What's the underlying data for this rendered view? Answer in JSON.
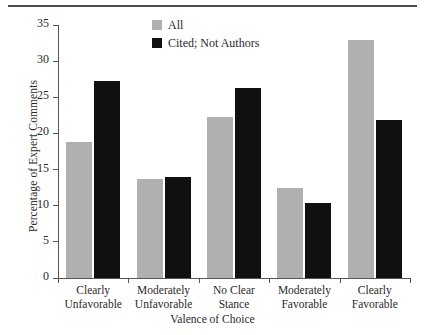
{
  "chart_data": {
    "type": "bar",
    "title": "",
    "categories": [
      "Clearly Unfavorable",
      "Moderately Unfavorable",
      "No Clear Stance",
      "Moderately Favorable",
      "Clearly Favorable"
    ],
    "category_lines": [
      [
        "Clearly",
        "Unfavorable"
      ],
      [
        "Moderately",
        "Unfavorable"
      ],
      [
        "No Clear",
        "Stance"
      ],
      [
        "Moderately",
        "Favorable"
      ],
      [
        "Clearly",
        "Favorable"
      ]
    ],
    "series": [
      {
        "name": "All",
        "color": "#b0b0b0",
        "values": [
          18.8,
          13.7,
          22.3,
          12.5,
          32.9
        ]
      },
      {
        "name": "Cited; Not Authors",
        "color": "#101010",
        "values": [
          27.2,
          14.0,
          26.3,
          10.4,
          21.9
        ]
      }
    ],
    "xlabel": "Valence of Choice",
    "ylabel": "Percentage of Expert Comments",
    "ylim": [
      0,
      35
    ],
    "yticks": [
      0,
      5,
      10,
      15,
      20,
      25,
      30,
      35
    ],
    "ytick_labels": [
      "0",
      "5",
      "10",
      "15",
      "20",
      "25",
      "30",
      "35"
    ],
    "grid": false,
    "legend_position": "top-center"
  },
  "legend": {
    "entries": [
      {
        "label": "All",
        "swatch": "legend-swatch-all"
      },
      {
        "label": "Cited; Not Authors",
        "swatch": "legend-swatch-cited"
      }
    ]
  }
}
